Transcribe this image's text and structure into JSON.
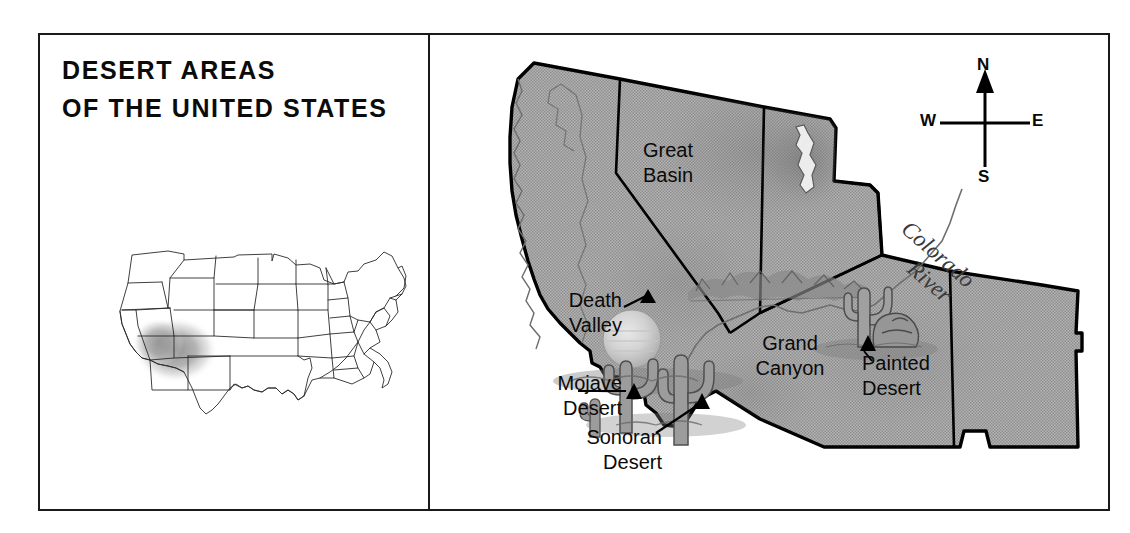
{
  "figure": {
    "title_lines": [
      "DESERT AREAS",
      "OF THE UNITED STATES"
    ],
    "colors": {
      "land_fill": "#a9a9a9",
      "land_fill_light": "#b4b4b4",
      "state_border": "#000000",
      "frame": "#1a1a1a",
      "text": "#0a0a0a",
      "inset_blob": "#9a9a9a",
      "water": "#ffffff"
    }
  },
  "inset_map": {
    "name": "united-states-locator-map",
    "description": "Outline map of the contiguous United States with state boundaries",
    "highlight_region": "Southwestern United States desert region"
  },
  "main_map": {
    "region": "Southwestern United States",
    "labels": [
      {
        "id": "great-basin",
        "name": "Great Basin",
        "lines": [
          "Great",
          "Basin"
        ],
        "marker": "none"
      },
      {
        "id": "death-valley",
        "name": "Death Valley",
        "lines": [
          "Death",
          "Valley"
        ],
        "marker": "triangle"
      },
      {
        "id": "mojave-desert",
        "name": "Mojave Desert",
        "lines": [
          "Mojave",
          "Desert"
        ],
        "marker": "triangle"
      },
      {
        "id": "sonoran-desert",
        "name": "Sonoran Desert",
        "lines": [
          "Sonoran",
          "Desert"
        ],
        "marker": "triangle"
      },
      {
        "id": "grand-canyon",
        "name": "Grand Canyon",
        "lines": [
          "Grand",
          "Canyon"
        ],
        "marker": "none"
      },
      {
        "id": "painted-desert",
        "name": "Painted Desert",
        "lines": [
          "Painted",
          "Desert"
        ],
        "marker": "triangle"
      }
    ],
    "river": {
      "id": "colorado-river",
      "lines": [
        "Colorado",
        "River"
      ],
      "style": "italic-serif"
    },
    "illustrations": [
      "sun",
      "saguaro-cactus",
      "canyon-ridge",
      "rock-formation",
      "great-salt-lake"
    ]
  },
  "compass": {
    "name": "compass-rose",
    "north": "N",
    "south": "S",
    "west": "W",
    "east": "E"
  }
}
